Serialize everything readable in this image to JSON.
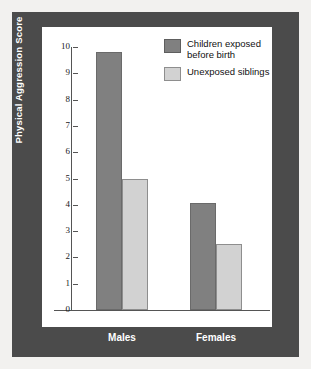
{
  "chart_data": {
    "type": "bar",
    "title": "",
    "xlabel": "",
    "ylabel": "Physical Aggression Score",
    "ylim": [
      0,
      10
    ],
    "yticks": [
      "0",
      "1",
      "2",
      "3",
      "4",
      "5",
      "6",
      "7",
      "8",
      "9",
      "10"
    ],
    "grid": false,
    "legend_position": "top-right",
    "categories": [
      "Males",
      "Females"
    ],
    "series": [
      {
        "name": "Children exposed before birth",
        "color": "#808080",
        "values": [
          9.8,
          4.05
        ]
      },
      {
        "name": "Unexposed siblings",
        "color": "#d2d2d2",
        "values": [
          5.0,
          2.5
        ]
      }
    ]
  },
  "legend": {
    "items": [
      {
        "label_line1": "Children exposed",
        "label_line2": "before birth",
        "swatch": "dark-gray-swatch"
      },
      {
        "label_line1": "Unexposed siblings",
        "label_line2": "",
        "swatch": "light-gray-swatch"
      }
    ]
  },
  "colors": {
    "frame": "#4b4b4b",
    "panel": "#ffffff",
    "axis": "#555555",
    "series_dark": "#808080",
    "series_light": "#d2d2d2",
    "label_on_frame": "#ffffff"
  }
}
